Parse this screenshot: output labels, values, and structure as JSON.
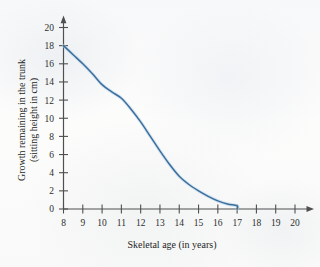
{
  "chart_data": {
    "type": "line",
    "title": "",
    "xlabel": "Skeletal age (in years)",
    "ylabel_line1": "Growth remaining in the trunk",
    "ylabel_line2": "(sitting height in cm)",
    "xlim": [
      8,
      20
    ],
    "ylim": [
      0,
      20
    ],
    "xticks": [
      8,
      9,
      10,
      11,
      12,
      13,
      14,
      15,
      16,
      17,
      18,
      19,
      20
    ],
    "yticks": [
      0,
      2,
      4,
      6,
      8,
      10,
      12,
      14,
      16,
      18,
      20
    ],
    "grid": false,
    "legend": false,
    "series": [
      {
        "name": "Growth remaining",
        "color": "#3a6e9e",
        "x": [
          8,
          8.5,
          9,
          9.5,
          10,
          10.5,
          11,
          11.5,
          12,
          12.5,
          13,
          13.5,
          14,
          14.5,
          15,
          15.5,
          16,
          16.5,
          17,
          17
        ],
        "values": [
          18.0,
          17.0,
          16.0,
          14.9,
          13.7,
          12.9,
          12.2,
          11.0,
          9.6,
          8.0,
          6.4,
          4.9,
          3.6,
          2.7,
          2.0,
          1.4,
          0.9,
          0.55,
          0.35,
          0.0
        ]
      }
    ],
    "annotations": [
      "curve begins at (8, 18) on the vertical axis",
      "curve terminates at skeletal age 17 where growth remaining reaches 0",
      "both axes drawn with arrowheads at their far ends"
    ]
  },
  "axes": {
    "x_axis_name": "skeletal-age-axis",
    "y_axis_name": "growth-remaining-axis"
  }
}
